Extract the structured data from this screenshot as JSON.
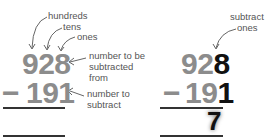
{
  "left_panel": {
    "labels": {
      "hundreds": "hundreds",
      "tens": "tens",
      "ones": "ones",
      "minuend_label": [
        "number to be",
        "subtracted",
        "from"
      ],
      "subtrahend_label": [
        "number to",
        "subtract"
      ]
    },
    "minuend": "928",
    "operator": "−",
    "subtrahend": "191"
  },
  "right_panel": {
    "labels": {
      "step": [
        "subtract",
        "ones"
      ]
    },
    "minuend_gray": "92",
    "minuend_highlight": "8",
    "operator": "−",
    "subtrahend_gray": "19",
    "subtrahend_highlight": "1",
    "result": "7"
  },
  "colors": {
    "digit_gray": "#8c8c8c",
    "digit_dark": "#111111",
    "label": "#555555"
  }
}
